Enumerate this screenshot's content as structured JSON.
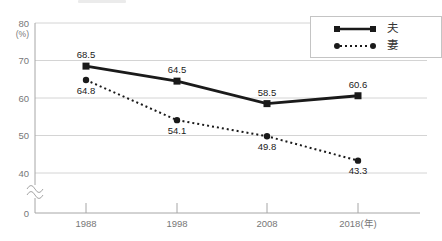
{
  "chart_data": {
    "type": "line",
    "title": "",
    "unit_label": "(%)",
    "categories": [
      "1988",
      "1998",
      "2008",
      "2018(年)"
    ],
    "y_ticks": [
      80,
      70,
      60,
      50,
      40
    ],
    "y_axis_base": "0",
    "ylim": [
      40,
      80
    ],
    "axis_break": true,
    "grid": true,
    "legend_position": "top-right",
    "series": [
      {
        "name": "夫",
        "values": [
          68.5,
          64.5,
          58.5,
          60.6
        ],
        "line": "solid",
        "marker": "square",
        "label_pos": "above"
      },
      {
        "name": "妻",
        "values": [
          64.8,
          54.1,
          49.8,
          43.3
        ],
        "line": "dotted",
        "marker": "circle",
        "label_pos": "below"
      }
    ]
  },
  "colors": {
    "series": "#1a1a1a",
    "grid": "#d4d4d4",
    "axis": "#a6a6a6",
    "tick_text": "#777777",
    "label_text": "#1a1a1a",
    "legend_border": "#c4c4c4"
  }
}
